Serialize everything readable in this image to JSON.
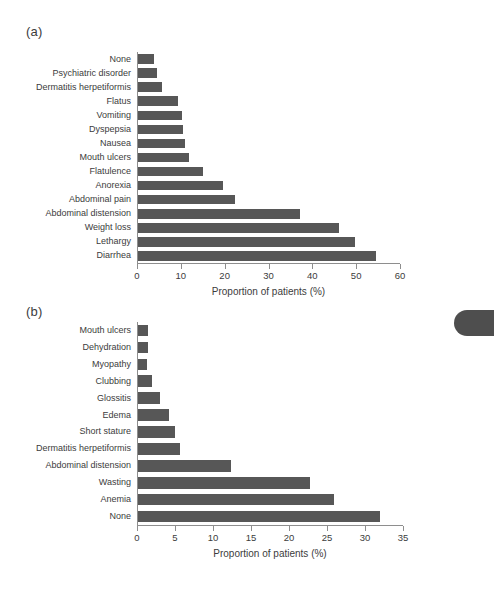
{
  "figure": {
    "background_color": "#ffffff",
    "bar_color": "#575757",
    "axis_color": "#8e8e8e",
    "text_color": "#3c3c3c",
    "edge_tab": {
      "name": "page-edge-tab",
      "color": "#4e4e4e"
    }
  },
  "panels": [
    {
      "letter": "(a)",
      "xlabel": "Proportion of patients (%)"
    },
    {
      "letter": "(b)",
      "xlabel": "Proportion of patients (%)"
    }
  ],
  "chart_data": [
    {
      "type": "bar",
      "orientation": "horizontal",
      "panel": "(a)",
      "title": "",
      "xlabel": "Proportion of patients (%)",
      "ylabel": "",
      "xlim": [
        0,
        60
      ],
      "xticks": [
        0,
        10,
        20,
        30,
        40,
        50,
        60
      ],
      "ticklabels": [
        "0",
        "10",
        "20",
        "30",
        "40",
        "50",
        "60"
      ],
      "grid": false,
      "legend": false,
      "categories": [
        "None",
        "Psychiatric disorder",
        "Dermatitis herpetiformis",
        "Flatus",
        "Vomiting",
        "Dyspepsia",
        "Nausea",
        "Mouth ulcers",
        "Flatulence",
        "Anorexia",
        "Abdominal pain",
        "Abdominal distension",
        "Weight loss",
        "Lethargy",
        "Diarrhea"
      ],
      "values": [
        3.7,
        4.4,
        5.5,
        9.2,
        10.1,
        10.2,
        10.7,
        11.7,
        14.9,
        19.4,
        22.2,
        37,
        46,
        49.7,
        54.5
      ]
    },
    {
      "type": "bar",
      "orientation": "horizontal",
      "panel": "(b)",
      "title": "",
      "xlabel": "Proportion of patients (%)",
      "ylabel": "",
      "xlim": [
        0,
        35
      ],
      "xticks": [
        0,
        5,
        10,
        15,
        20,
        25,
        30,
        35
      ],
      "ticklabels": [
        "0",
        "5",
        "10",
        "15",
        "20",
        "25",
        "30",
        "35"
      ],
      "grid": false,
      "legend": false,
      "categories": [
        "Mouth ulcers",
        "Dehydration",
        "Myopathy",
        "Clubbing",
        "Glossitis",
        "Edema",
        "Short stature",
        "Dermatitis herpetiformis",
        "Abdominal distension",
        "Wasting",
        "Anemia",
        "None"
      ],
      "values": [
        1.3,
        1.3,
        1.2,
        1.8,
        2.9,
        4.1,
        4.9,
        5.5,
        12.3,
        22.7,
        25.9,
        32.0
      ]
    }
  ]
}
